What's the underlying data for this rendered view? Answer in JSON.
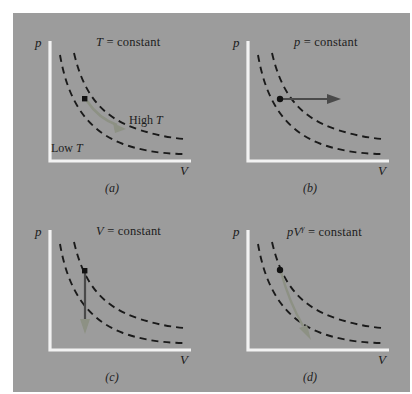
{
  "figure": {
    "background_color": "#9c9c9c",
    "page_color": "#ffffff",
    "axis_color": "#f2f2f2",
    "curve_color": "#1a1a1a",
    "dot_color": "#111111",
    "arrow_gray_green": "#8d9184",
    "arrow_dark": "#4a4a4a"
  },
  "panels": [
    {
      "id": "a",
      "caption": "(a)",
      "title_italic": "T",
      "title_rest": " = constant",
      "y_axis_label": "p",
      "x_axis_label": "V",
      "curve_labels": [
        {
          "prefix": "High ",
          "symbol": "T"
        },
        {
          "prefix": "Low ",
          "symbol": "T"
        }
      ],
      "process": "isothermal-expansion",
      "arrow_direction": "along-upper-isotherm-down-right"
    },
    {
      "id": "b",
      "caption": "(b)",
      "title_italic": "p",
      "title_rest": " = constant",
      "y_axis_label": "p",
      "x_axis_label": "V",
      "curve_labels": [],
      "process": "isobaric-expansion",
      "arrow_direction": "horizontal-right"
    },
    {
      "id": "c",
      "caption": "(c)",
      "title_italic": "V",
      "title_rest": " = constant",
      "y_axis_label": "p",
      "x_axis_label": "V",
      "curve_labels": [],
      "process": "isochoric-cooling",
      "arrow_direction": "vertical-down"
    },
    {
      "id": "d",
      "caption": "(d)",
      "title_italic": "pV",
      "title_superscript": "γ",
      "title_rest": " = constant",
      "y_axis_label": "p",
      "x_axis_label": "V",
      "curve_labels": [],
      "process": "adiabatic-expansion",
      "arrow_direction": "steep-down-right-across-isotherms"
    }
  ]
}
